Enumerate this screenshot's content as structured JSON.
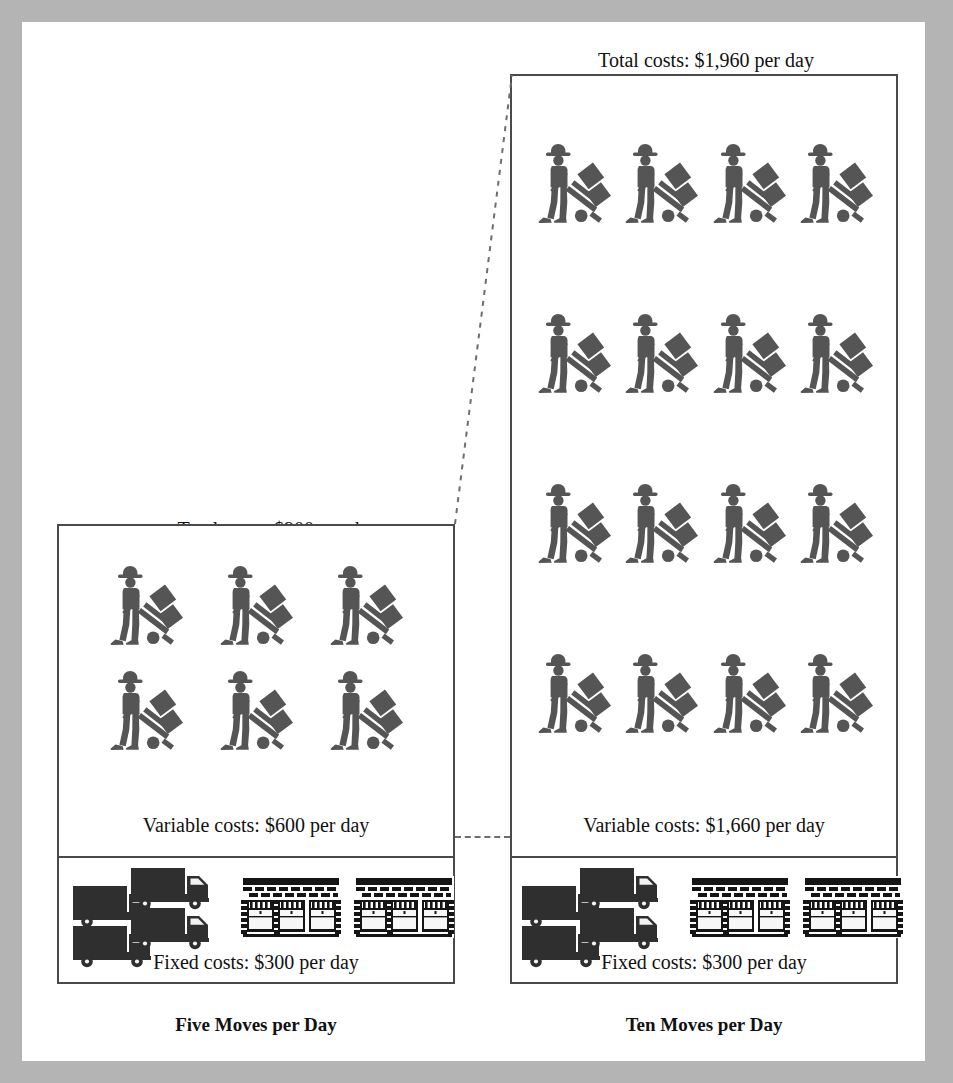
{
  "figure": {
    "background_color": "#b4b4b4",
    "page_color": "#ffffff",
    "line_color": "#4a4a4a",
    "icon_color": "#555555"
  },
  "panels": [
    {
      "id": "five-moves",
      "total_costs_label": "Total costs: $900 per day",
      "variable_costs_label": "Variable costs: $600 per day",
      "fixed_costs_label": "Fixed costs: $300 per day",
      "caption": "Five Moves per Day",
      "worker_count": 6,
      "worker_rows": 2,
      "worker_cols": 3,
      "truck_count": 4,
      "warehouse_count": 2
    },
    {
      "id": "ten-moves",
      "total_costs_label": "Total costs: $1,960 per day",
      "variable_costs_label": "Variable costs: $1,660 per day",
      "fixed_costs_label": "Fixed costs: $300 per day",
      "caption": "Ten Moves per Day",
      "worker_count": 16,
      "worker_rows": 4,
      "worker_cols": 4,
      "truck_count": 4,
      "warehouse_count": 2
    }
  ],
  "icons": {
    "worker": "worker-handtruck-icon",
    "truck": "box-truck-icon",
    "warehouse": "warehouse-dock-icon"
  },
  "chart_data": {
    "type": "table",
    "categories": [
      "Five Moves per Day",
      "Ten Moves per Day"
    ],
    "series": [
      {
        "name": "Fixed costs ($/day)",
        "values": [
          300,
          300
        ]
      },
      {
        "name": "Variable costs ($/day)",
        "values": [
          600,
          1660
        ]
      },
      {
        "name": "Total costs ($/day)",
        "values": [
          900,
          1960
        ]
      }
    ],
    "pictogram_units": [
      {
        "name": "Workers (variable)",
        "values": [
          6,
          16
        ]
      },
      {
        "name": "Trucks (fixed)",
        "values": [
          4,
          4
        ]
      },
      {
        "name": "Warehouses (fixed)",
        "values": [
          2,
          2
        ]
      }
    ],
    "xlabel": "",
    "ylabel": "Cost per day ($)",
    "grid": false,
    "legend": "none"
  }
}
